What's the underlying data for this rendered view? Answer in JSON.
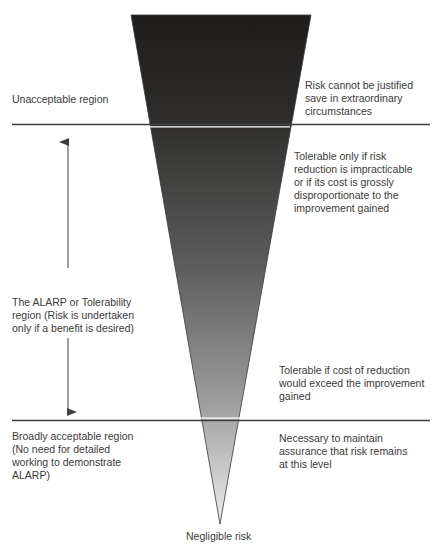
{
  "diagram": {
    "type": "ALARP triangle",
    "colors": {
      "triangle_top": "#1f1d1b",
      "triangle_mid": "#5e5e5e",
      "triangle_bottom": "#e6e6e6",
      "lines": "#3f3f3f",
      "text": "#3a3a3a"
    },
    "left_labels": {
      "unacceptable": "Unacceptable region",
      "alarp": "The ALARP or Tolerability\nregion (Risk is undertaken\nonly if a benefit is desired)",
      "broadly_acceptable": "Broadly acceptable region\n(No need for detailed\nworking to demonstrate\nALARP)"
    },
    "right_labels": {
      "unacceptable": "Risk cannot be justified\nsave in extraordinary\ncircumstances",
      "tolerable_only_if": "Tolerable only if risk\nreduction is impracticable\nor if its cost is grossly\ndisproportionate to the\nimprovement gained",
      "tolerable_if_cost": "Tolerable if cost of reduction\nwould exceed the improvement\ngained",
      "necessary": "Necessary to maintain\nassurance that risk remains\nat this level"
    },
    "bottom_label": "Negligible risk"
  }
}
